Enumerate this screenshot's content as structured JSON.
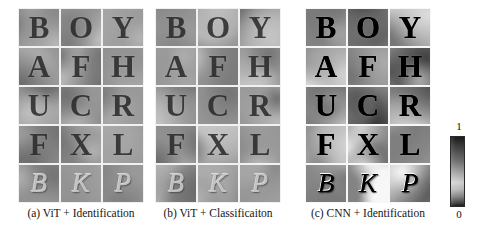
{
  "figure": {
    "background_color": "#ffffff",
    "width": 477,
    "height": 243
  },
  "letters_grid": {
    "rows": 5,
    "cols": 3,
    "items": [
      {
        "char": "B",
        "style": "roman"
      },
      {
        "char": "O",
        "style": "roman"
      },
      {
        "char": "Y",
        "style": "roman"
      },
      {
        "char": "A",
        "style": "roman"
      },
      {
        "char": "F",
        "style": "roman"
      },
      {
        "char": "H",
        "style": "roman"
      },
      {
        "char": "U",
        "style": "roman"
      },
      {
        "char": "C",
        "style": "roman"
      },
      {
        "char": "R",
        "style": "roman"
      },
      {
        "char": "F",
        "style": "roman"
      },
      {
        "char": "X",
        "style": "roman"
      },
      {
        "char": "L",
        "style": "roman"
      },
      {
        "char": "B",
        "style": "script"
      },
      {
        "char": "K",
        "style": "script"
      },
      {
        "char": "P",
        "style": "script"
      }
    ]
  },
  "panels": [
    {
      "id": "panel-a",
      "caption": "(a) ViT + Identification",
      "model": "ViT",
      "task": "Identification",
      "contrast": "soft",
      "left": 18,
      "width": 126
    },
    {
      "id": "panel-b",
      "caption": "(b) ViT + Classificaiton",
      "model": "ViT",
      "task": "Classificaiton",
      "contrast": "soft",
      "left": 155,
      "width": 126
    },
    {
      "id": "panel-c",
      "caption": "(c) CNN + Identification",
      "model": "CNN",
      "task": "Identification",
      "contrast": "sharp",
      "left": 305,
      "width": 126
    }
  ],
  "colorbar": {
    "name": "attention-intensity-colorbar",
    "orientation": "vertical",
    "max_label": "1",
    "min_label": "0",
    "max_value": 1,
    "min_value": 0,
    "colormap": "grayscale",
    "high_color": "#1c1c1c",
    "low_color": "#1e1e1e",
    "mid_color": "#d6d6d6"
  },
  "chart_data": {
    "type": "heatmap",
    "title": "",
    "subtitle": "",
    "xlabel": "",
    "ylabel": "",
    "grid": false,
    "legend_position": "right",
    "colorbar": {
      "label": "",
      "ticks": [
        "0",
        "1"
      ],
      "range": [
        0,
        1
      ],
      "colormap": "grayscale"
    },
    "panels": [
      {
        "name": "(a) ViT + Identification",
        "rows": 5,
        "cols": 3,
        "cell_labels": [
          [
            "B",
            "O",
            "Y"
          ],
          [
            "A",
            "F",
            "H"
          ],
          [
            "U",
            "C",
            "R"
          ],
          [
            "F",
            "X",
            "L"
          ],
          [
            "B",
            "K",
            "P"
          ]
        ]
      },
      {
        "name": "(b) ViT + Classificaiton",
        "rows": 5,
        "cols": 3,
        "cell_labels": [
          [
            "B",
            "O",
            "Y"
          ],
          [
            "A",
            "F",
            "H"
          ],
          [
            "U",
            "C",
            "R"
          ],
          [
            "F",
            "X",
            "L"
          ],
          [
            "B",
            "K",
            "P"
          ]
        ]
      },
      {
        "name": "(c) CNN + Identification",
        "rows": 5,
        "cols": 3,
        "cell_labels": [
          [
            "B",
            "O",
            "Y"
          ],
          [
            "A",
            "F",
            "H"
          ],
          [
            "U",
            "C",
            "R"
          ],
          [
            "F",
            "X",
            "L"
          ],
          [
            "B",
            "K",
            "P"
          ]
        ]
      }
    ]
  }
}
